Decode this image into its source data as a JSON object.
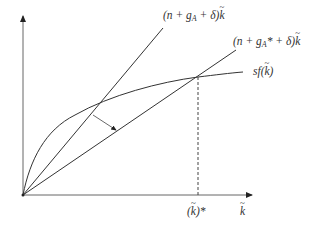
{
  "diagram": {
    "curves": [
      {
        "id": "steep-line",
        "label_pre": "(n + g",
        "label_sub": "A",
        "label_post": " + δ)",
        "label_var": "k"
      },
      {
        "id": "flat-line",
        "label_pre": "(n + g",
        "label_sub": "A",
        "label_post": "* + δ)",
        "label_var": "k"
      },
      {
        "id": "production-curve",
        "label_pre": "sf(",
        "label_var": "k",
        "label_post": ")"
      }
    ],
    "x_axis": {
      "label_var": "k"
    },
    "steady_state": {
      "label_open": "(",
      "label_var": "k",
      "label_close": ")*"
    },
    "colors": {
      "line": "#333333",
      "background": "#ffffff"
    }
  }
}
